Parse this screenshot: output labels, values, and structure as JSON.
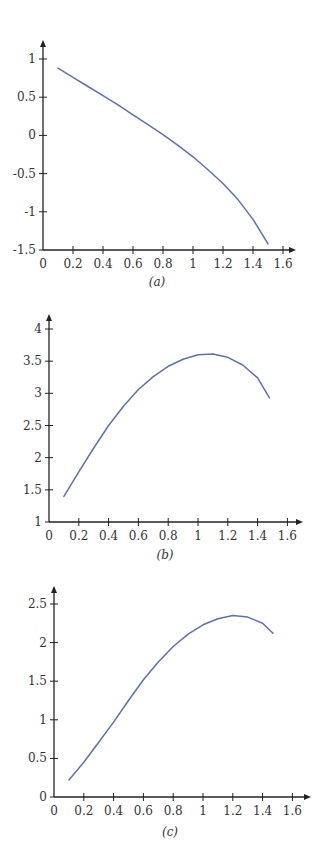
{
  "colors": {
    "line": "#5b6fbf",
    "axis": "#222222",
    "text": "#333333"
  },
  "chart_data": [
    {
      "type": "line",
      "caption": "(a)",
      "title": "",
      "xlabel": "",
      "ylabel": "",
      "grid": false,
      "legend": null,
      "xlim": [
        0,
        1.6
      ],
      "ylim": [
        -1.5,
        1
      ],
      "x_ticks": [
        0,
        0.2,
        0.4,
        0.6,
        0.8,
        1,
        1.2,
        1.4,
        1.6
      ],
      "y_ticks": [
        -1.5,
        -1,
        -0.5,
        0,
        0.5,
        1
      ],
      "x_tick_labels": [
        "0",
        "0.2",
        "0.4",
        "0.6",
        "0.8",
        "1",
        "1.2",
        "1.4",
        "1.6"
      ],
      "y_tick_labels": [
        "-1.5",
        "-1",
        "-0.5",
        "0",
        "0.5",
        "1"
      ],
      "series": [
        {
          "name": "curve-a",
          "x": [
            0.1,
            0.2,
            0.3,
            0.4,
            0.5,
            0.6,
            0.7,
            0.8,
            0.9,
            1.0,
            1.1,
            1.2,
            1.3,
            1.4,
            1.5
          ],
          "y": [
            0.88,
            0.76,
            0.64,
            0.52,
            0.4,
            0.27,
            0.14,
            0.01,
            -0.13,
            -0.28,
            -0.45,
            -0.63,
            -0.84,
            -1.1,
            -1.42
          ]
        }
      ],
      "layout": {
        "ox": 43,
        "x_axis_y": 250,
        "px_per_x": 150,
        "y_min_px": 250,
        "y_max_px": 59,
        "axis_top": 40,
        "axis_right": 296,
        "caption_x": 157,
        "caption_y": 286
      }
    },
    {
      "type": "line",
      "caption": "(b)",
      "title": "",
      "xlabel": "",
      "ylabel": "",
      "grid": false,
      "legend": null,
      "xlim": [
        0,
        1.6
      ],
      "ylim": [
        1,
        4
      ],
      "x_ticks": [
        0,
        0.2,
        0.4,
        0.6,
        0.8,
        1,
        1.2,
        1.4,
        1.6
      ],
      "y_ticks": [
        1,
        1.5,
        2,
        2.5,
        3,
        3.5,
        4
      ],
      "x_tick_labels": [
        "0",
        "0.2",
        "0.4",
        "0.6",
        "0.8",
        "1",
        "1.2",
        "1.4",
        "1.6"
      ],
      "y_tick_labels": [
        "1",
        "1.5",
        "2",
        "2.5",
        "3",
        "3.5",
        "4"
      ],
      "series": [
        {
          "name": "curve-b",
          "x": [
            0.1,
            0.2,
            0.3,
            0.4,
            0.5,
            0.6,
            0.7,
            0.8,
            0.9,
            1.0,
            1.1,
            1.2,
            1.3,
            1.4,
            1.48
          ],
          "y": [
            1.4,
            1.78,
            2.15,
            2.5,
            2.8,
            3.06,
            3.26,
            3.42,
            3.53,
            3.6,
            3.61,
            3.56,
            3.44,
            3.24,
            2.93
          ]
        }
      ],
      "layout": {
        "ox": 49,
        "x_axis_y": 522,
        "px_per_x": 149,
        "y_min_px": 522,
        "y_max_px": 329,
        "axis_top": 314,
        "axis_right": 303,
        "caption_x": 165,
        "caption_y": 559
      }
    },
    {
      "type": "line",
      "caption": "(c)",
      "title": "",
      "xlabel": "",
      "ylabel": "",
      "grid": false,
      "legend": null,
      "xlim": [
        0,
        1.6
      ],
      "ylim": [
        0,
        2.5
      ],
      "x_ticks": [
        0,
        0.2,
        0.4,
        0.6,
        0.8,
        1,
        1.2,
        1.4,
        1.6
      ],
      "y_ticks": [
        0,
        0.5,
        1,
        1.5,
        2,
        2.5
      ],
      "x_tick_labels": [
        "0",
        "0.2",
        "0.4",
        "0.6",
        "0.8",
        "1",
        "1.2",
        "1.4",
        "1.6"
      ],
      "y_tick_labels": [
        "0",
        "0.5",
        "1",
        "1.5",
        "2",
        "2.5"
      ],
      "series": [
        {
          "name": "curve-c",
          "x": [
            0.1,
            0.2,
            0.3,
            0.4,
            0.5,
            0.6,
            0.7,
            0.8,
            0.9,
            1.0,
            1.1,
            1.2,
            1.3,
            1.4,
            1.47
          ],
          "y": [
            0.22,
            0.45,
            0.71,
            0.97,
            1.25,
            1.52,
            1.75,
            1.95,
            2.11,
            2.23,
            2.31,
            2.35,
            2.33,
            2.25,
            2.12
          ]
        }
      ],
      "layout": {
        "ox": 54,
        "x_axis_y": 797,
        "px_per_x": 149,
        "y_min_px": 797,
        "y_max_px": 604,
        "axis_top": 586,
        "axis_right": 311,
        "caption_x": 170,
        "caption_y": 836
      }
    }
  ]
}
